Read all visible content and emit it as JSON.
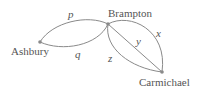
{
  "diagram": {
    "type": "graph",
    "nodes": [
      {
        "id": "A",
        "label": "Ashbury"
      },
      {
        "id": "B",
        "label": "Brampton"
      },
      {
        "id": "C",
        "label": "Carmichael"
      }
    ],
    "edges": [
      {
        "label": "p",
        "from": "Ashbury",
        "to": "Brampton"
      },
      {
        "label": "q",
        "from": "Ashbury",
        "to": "Brampton"
      },
      {
        "label": "x",
        "from": "Brampton",
        "to": "Carmichael"
      },
      {
        "label": "y",
        "from": "Brampton",
        "to": "Carmichael"
      },
      {
        "label": "z",
        "from": "Brampton",
        "to": "Carmichael"
      }
    ]
  }
}
